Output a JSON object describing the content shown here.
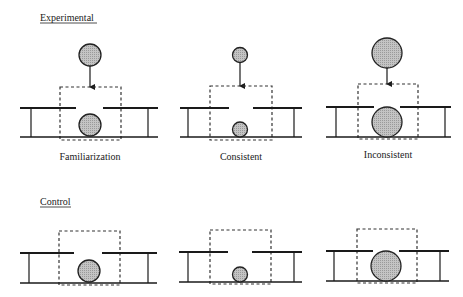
{
  "rows": [
    {
      "label": "Experimental",
      "panels": [
        {
          "caption": "Familiarization",
          "ball_size": "medium",
          "dropped_ball": true
        },
        {
          "caption": "Consistent",
          "ball_size": "small",
          "dropped_ball": true
        },
        {
          "caption": "Inconsistent",
          "ball_size": "large",
          "dropped_ball": true
        }
      ]
    },
    {
      "label": "Control",
      "panels": [
        {
          "caption": "",
          "ball_size": "medium",
          "dropped_ball": false
        },
        {
          "caption": "",
          "ball_size": "small",
          "dropped_ball": false
        },
        {
          "caption": "",
          "ball_size": "large",
          "dropped_ball": false
        }
      ]
    }
  ],
  "colors": {
    "ball_fill": "#b8b8b8",
    "line": "#1a1a1a",
    "background": "#ffffff"
  }
}
